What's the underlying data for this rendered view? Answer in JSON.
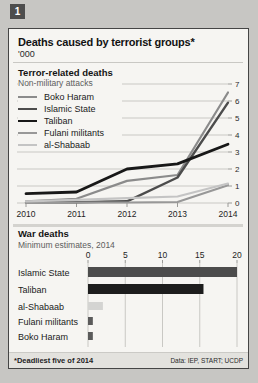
{
  "badge": "1",
  "card": {
    "title": "Deaths caused by terrorist groups*",
    "subtitle": "'000",
    "footnote": "*Deadliest five of 2014",
    "source": "Data: IEP, START; UCDP"
  },
  "colors": {
    "page_background": "#c7c6c3",
    "card_background": "#f6f5f2",
    "border": "#454545",
    "gridline": "#c9c8c4",
    "footer_background": "#e3e2de"
  },
  "chart_data": [
    {
      "type": "line",
      "title": "Terror-related deaths",
      "subtitle": "Non-military attacks",
      "unit": "'000",
      "x": [
        2010,
        2011,
        2012,
        2013,
        2014
      ],
      "xticklabels": [
        "2010",
        "2011",
        "2012",
        "2013",
        "2014"
      ],
      "ylim": [
        0,
        7
      ],
      "yticks": [
        0,
        1,
        2,
        3,
        4,
        5,
        6,
        7
      ],
      "yaxis_side": "right",
      "grid": true,
      "legend_position": "top-left",
      "series": [
        {
          "name": "Boko Haram",
          "color": "#8b8b8b",
          "width": 2.2,
          "values": [
            0.1,
            0.25,
            1.3,
            1.65,
            6.5
          ]
        },
        {
          "name": "Islamic State",
          "color": "#4c4c4c",
          "width": 2.4,
          "values": [
            0.05,
            0.05,
            0.1,
            1.5,
            5.9
          ]
        },
        {
          "name": "Taliban",
          "color": "#181818",
          "width": 2.8,
          "values": [
            0.55,
            0.65,
            2.0,
            2.3,
            3.45
          ]
        },
        {
          "name": "Fulani militants",
          "color": "#989898",
          "width": 2.2,
          "values": [
            0.02,
            0.03,
            0.03,
            0.06,
            1.05
          ]
        },
        {
          "name": "al-Shabaab",
          "color": "#c4c4c4",
          "width": 2.2,
          "values": [
            0.1,
            0.18,
            0.28,
            0.38,
            1.15
          ]
        }
      ]
    },
    {
      "type": "bar",
      "title": "War deaths",
      "subtitle": "Minimum estimates, 2014",
      "orientation": "horizontal",
      "xlim": [
        0,
        20
      ],
      "xticks": [
        0,
        5,
        10,
        15,
        20
      ],
      "grid": true,
      "categories": [
        "Islamic State",
        "Taliban",
        "al-Shabaab",
        "Fulani militants",
        "Boko Haram"
      ],
      "values": [
        20,
        15.5,
        2,
        0.65,
        0.65
      ],
      "colors": [
        "#4c4c4c",
        "#1d1d1d",
        "#d4d4d2",
        "#5b5b5b",
        "#5b5b5b"
      ]
    }
  ]
}
